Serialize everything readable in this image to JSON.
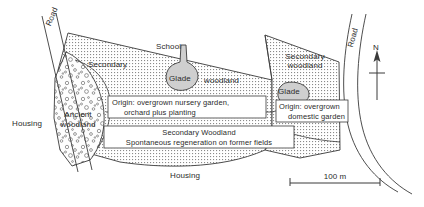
{
  "figure": {
    "type": "ecological-site-map"
  },
  "labels": {
    "road_left": "Road",
    "road_right": "Road",
    "school": "School",
    "housing_left": "Housing",
    "housing_bottom": "Housing",
    "secondary_left": "Secondary",
    "woodland_left": "woodland",
    "glade_left": "Glade",
    "glade_right": "Glade",
    "secondary_right_line1": "Secondary",
    "secondary_right_line2": "woodland",
    "ancient_line1": "Ancient",
    "ancient_line2": "woodland",
    "origin_left_line1": "Origin: overgrown nursery garden,",
    "origin_left_line2": "orchard plus planting",
    "secondary_woodland_box": "Secondary Woodland",
    "regeneration_box": "Spontaneous regeneration on former fields",
    "origin_right_line1": "Origin: overgrown",
    "origin_right_line2": "domestic garden",
    "north": "N",
    "scale_value": "100 m"
  },
  "icons": {
    "north_arrow": "north-arrow-icon",
    "scale_bar": "scale-bar-icon"
  },
  "colors": {
    "ink": "#2b2b2b",
    "line": "#3a3a3a",
    "glade_fill": "#cfcfcf",
    "hatch": "#7a7a7a",
    "paper": "#ffffff"
  },
  "scale": {
    "label": "100 m",
    "bar_length_px": 90
  }
}
